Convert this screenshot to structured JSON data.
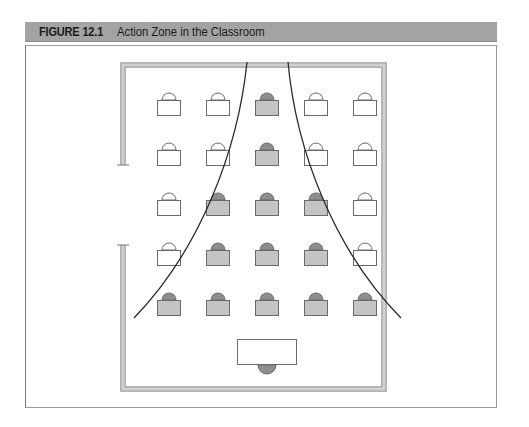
{
  "figure": {
    "number": "FIGURE 12.1",
    "title": "Action Zone in the Classroom"
  },
  "colors": {
    "header_bg": "#a3a3a3",
    "wall": "#a8a8a8",
    "desk_shaded": "#c4c4c4",
    "chair_shaded": "#8e8e8e",
    "desk_outline": "#6a6a6a",
    "curve": "#2a2a2a"
  },
  "classroom": {
    "rows": 5,
    "columns": 5,
    "desks": [
      {
        "row": 1,
        "col": 1,
        "in_action_zone": false
      },
      {
        "row": 1,
        "col": 2,
        "in_action_zone": false
      },
      {
        "row": 1,
        "col": 3,
        "in_action_zone": true
      },
      {
        "row": 1,
        "col": 4,
        "in_action_zone": false
      },
      {
        "row": 1,
        "col": 5,
        "in_action_zone": false
      },
      {
        "row": 2,
        "col": 1,
        "in_action_zone": false
      },
      {
        "row": 2,
        "col": 2,
        "in_action_zone": false
      },
      {
        "row": 2,
        "col": 3,
        "in_action_zone": true
      },
      {
        "row": 2,
        "col": 4,
        "in_action_zone": false
      },
      {
        "row": 2,
        "col": 5,
        "in_action_zone": false
      },
      {
        "row": 3,
        "col": 1,
        "in_action_zone": false
      },
      {
        "row": 3,
        "col": 2,
        "in_action_zone": true
      },
      {
        "row": 3,
        "col": 3,
        "in_action_zone": true
      },
      {
        "row": 3,
        "col": 4,
        "in_action_zone": true
      },
      {
        "row": 3,
        "col": 5,
        "in_action_zone": false
      },
      {
        "row": 4,
        "col": 1,
        "in_action_zone": false
      },
      {
        "row": 4,
        "col": 2,
        "in_action_zone": true
      },
      {
        "row": 4,
        "col": 3,
        "in_action_zone": true
      },
      {
        "row": 4,
        "col": 4,
        "in_action_zone": true
      },
      {
        "row": 4,
        "col": 5,
        "in_action_zone": false
      },
      {
        "row": 5,
        "col": 1,
        "in_action_zone": true
      },
      {
        "row": 5,
        "col": 2,
        "in_action_zone": true
      },
      {
        "row": 5,
        "col": 3,
        "in_action_zone": true
      },
      {
        "row": 5,
        "col": 4,
        "in_action_zone": true
      },
      {
        "row": 5,
        "col": 5,
        "in_action_zone": true
      }
    ],
    "teacher_desk": {
      "position": "front-center"
    },
    "door": {
      "wall": "left"
    }
  }
}
